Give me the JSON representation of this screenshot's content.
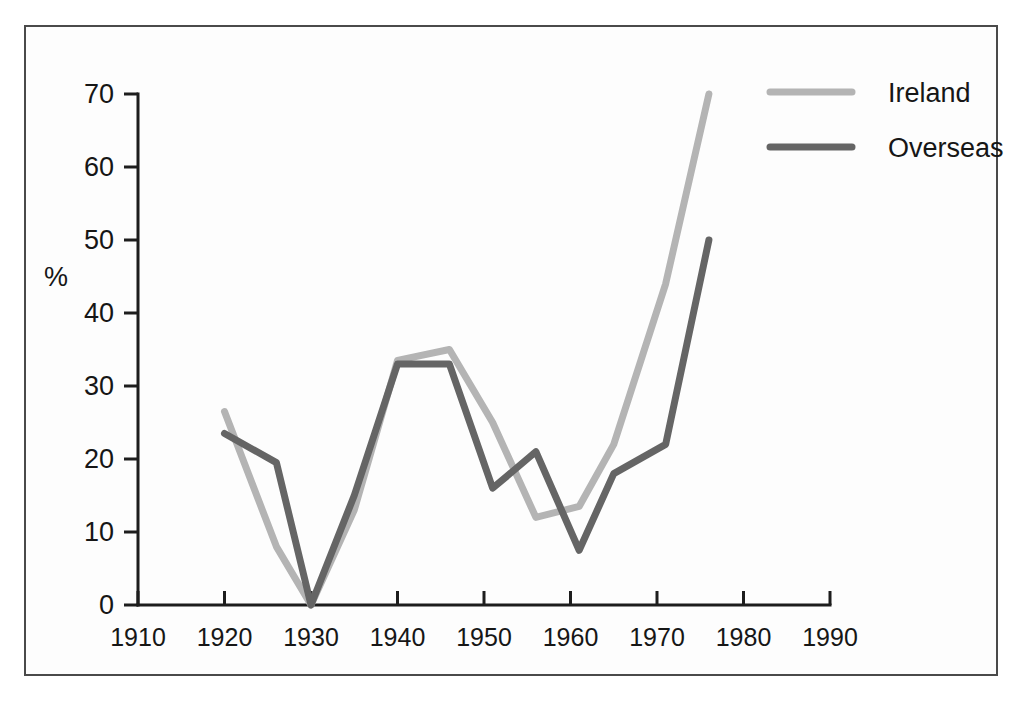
{
  "chart_data": {
    "type": "line",
    "title": "",
    "subtitle": "",
    "xlabel": "",
    "ylabel": "%",
    "xlim": [
      1910,
      1990
    ],
    "ylim": [
      0,
      70
    ],
    "xticks": [
      1910,
      1920,
      1930,
      1940,
      1950,
      1960,
      1970,
      1980,
      1990
    ],
    "xtick_labels": [
      "1910",
      "1920",
      "1930",
      "1940",
      "1950",
      "1960",
      "1970",
      "1980",
      "1990"
    ],
    "yticks": [
      0,
      10,
      20,
      30,
      40,
      50,
      60,
      70
    ],
    "ytick_labels": [
      "0",
      "10",
      "20",
      "30",
      "40",
      "50",
      "60",
      "70"
    ],
    "grid": false,
    "legend_position": "top-right",
    "series": [
      {
        "name": "Ireland",
        "color": "#b4b4b4",
        "x": [
          1920,
          1926,
          1930,
          1935,
          1940,
          1946,
          1951,
          1956,
          1961,
          1965,
          1971,
          1976
        ],
        "values": [
          26.5,
          8,
          0,
          13,
          33.5,
          35,
          25,
          12,
          13.5,
          22,
          44,
          70
        ]
      },
      {
        "name": "Overseas",
        "color": "#656565",
        "x": [
          1920,
          1926,
          1930,
          1935,
          1940,
          1946,
          1951,
          1956,
          1961,
          1965,
          1971,
          1976
        ],
        "values": [
          23.5,
          19.5,
          0,
          15,
          33,
          33,
          16,
          21,
          7.5,
          18,
          22,
          50
        ]
      }
    ]
  },
  "legend": {
    "items": [
      {
        "label": "Ireland",
        "color": "#b4b4b4"
      },
      {
        "label": "Overseas",
        "color": "#656565"
      }
    ]
  },
  "axes": {
    "y_axis_title": "%"
  },
  "colors": {
    "frame": "#4a4a4a",
    "axis": "#1d1d1d",
    "text": "#161616",
    "ireland": "#b4b4b4",
    "overseas": "#656565",
    "background": "#ffffff"
  }
}
